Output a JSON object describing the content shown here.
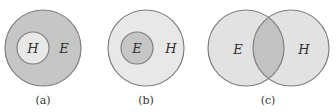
{
  "colors": {
    "dark_fill": "#c6c6c6",
    "light_fill": "#e8e8e8",
    "overlap_fill": "#b9b9b9",
    "stroke": "#7f7f7f"
  },
  "diagrams": [
    {
      "caption": "(a)",
      "outer_set": "E",
      "inner_set": "H",
      "relation": "H subset of E"
    },
    {
      "caption": "(b)",
      "outer_set": "H",
      "inner_set": "E",
      "relation": "E subset of H"
    },
    {
      "caption": "(c)",
      "left_set": "E",
      "right_set": "H",
      "relation": "E and H overlap"
    }
  ]
}
